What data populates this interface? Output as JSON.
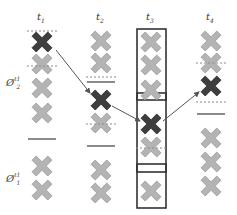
{
  "colors": {
    "item": "#b4b4b4",
    "item_stroke": "#9a9a9a",
    "highlight": "#3e3e3e",
    "highlight_stroke": "#2a2a2a",
    "line": "#8c8c8c",
    "dashed": "#8a8a8a",
    "box": "#333333",
    "arrow": "#555555"
  },
  "columns": [
    {
      "label_base": "t",
      "label_sub": "1",
      "x": 42
    },
    {
      "label_base": "t",
      "label_sub": "2",
      "x": 101
    },
    {
      "label_base": "t",
      "label_sub": "3",
      "x": 151
    },
    {
      "label_base": "t",
      "label_sub": "4",
      "x": 211
    }
  ],
  "row_labels": [
    {
      "base": "Ø",
      "sup": "t1",
      "sub": "2",
      "x": 6,
      "y": 78
    },
    {
      "base": "Ø",
      "sup": "t1",
      "sub": "1",
      "x": 6,
      "y": 174
    }
  ],
  "items": [
    {
      "col": 0,
      "y": 42,
      "kind": "highlight"
    },
    {
      "col": 0,
      "y": 64,
      "kind": "item"
    },
    {
      "col": 0,
      "y": 88,
      "kind": "item"
    },
    {
      "col": 0,
      "y": 113,
      "kind": "item"
    },
    {
      "col": 0,
      "y": 166,
      "kind": "item"
    },
    {
      "col": 0,
      "y": 190,
      "kind": "item"
    },
    {
      "col": 1,
      "y": 41,
      "kind": "item"
    },
    {
      "col": 1,
      "y": 63,
      "kind": "item"
    },
    {
      "col": 1,
      "y": 100,
      "kind": "highlight"
    },
    {
      "col": 1,
      "y": 123,
      "kind": "item"
    },
    {
      "col": 1,
      "y": 170,
      "kind": "item"
    },
    {
      "col": 1,
      "y": 193,
      "kind": "item"
    },
    {
      "col": 2,
      "y": 42,
      "kind": "item"
    },
    {
      "col": 2,
      "y": 65,
      "kind": "item"
    },
    {
      "col": 2,
      "y": 90,
      "kind": "item"
    },
    {
      "col": 2,
      "y": 124,
      "kind": "highlight"
    },
    {
      "col": 2,
      "y": 147,
      "kind": "item"
    },
    {
      "col": 2,
      "y": 191,
      "kind": "item"
    },
    {
      "col": 3,
      "y": 41,
      "kind": "item"
    },
    {
      "col": 3,
      "y": 63,
      "kind": "item"
    },
    {
      "col": 3,
      "y": 86,
      "kind": "highlight"
    },
    {
      "col": 3,
      "y": 138,
      "kind": "item"
    },
    {
      "col": 3,
      "y": 162,
      "kind": "item"
    },
    {
      "col": 3,
      "y": 186,
      "kind": "item"
    }
  ],
  "dashed_lines": [
    {
      "col": 0,
      "y": 31
    },
    {
      "col": 0,
      "y": 66
    },
    {
      "col": 1,
      "y": 77
    },
    {
      "col": 1,
      "y": 124
    },
    {
      "col": 2,
      "y": 148
    },
    {
      "col": 3,
      "y": 63
    },
    {
      "col": 3,
      "y": 102
    }
  ],
  "solid_lines": [
    {
      "col": 0,
      "y": 139
    },
    {
      "col": 1,
      "y": 82
    },
    {
      "col": 1,
      "y": 146
    },
    {
      "col": 3,
      "y": 114
    }
  ],
  "boxes": [
    {
      "x": 137,
      "y": 29,
      "w": 29,
      "h": 179
    },
    {
      "x": 137,
      "y": 93,
      "w": 29,
      "h": 7
    },
    {
      "x": 137,
      "y": 164,
      "w": 29,
      "h": 8
    }
  ],
  "arrows": [
    {
      "x1": 56,
      "y1": 50,
      "x2": 90,
      "y2": 93
    },
    {
      "x1": 112,
      "y1": 106,
      "x2": 140,
      "y2": 121
    },
    {
      "x1": 163,
      "y1": 121,
      "x2": 199,
      "y2": 92
    }
  ]
}
